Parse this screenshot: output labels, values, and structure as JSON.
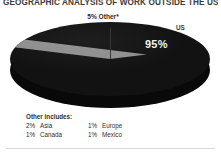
{
  "chart_data": {
    "type": "pie",
    "title": "GEOGRAPHIC ANALYSIS OF WORK OUTSIDE THE US",
    "xlabel": "",
    "ylabel": "",
    "categories": [
      "US",
      "Other"
    ],
    "values": [
      95,
      5
    ],
    "labels": [
      "95%",
      "5% Other*"
    ],
    "series_label": "US",
    "slice_colors": [
      "#121212",
      "#8e8e8e"
    ],
    "legend_position": "none",
    "grid": false,
    "annotations": {
      "us_label": "US",
      "us_value_label": "95%",
      "other_callout": "5% Other*"
    },
    "footnote": {
      "heading": "Other includes:",
      "items": [
        {
          "pct": "2%",
          "name": "Asia"
        },
        {
          "pct": "1%",
          "name": "Europe"
        },
        {
          "pct": "1%",
          "name": "Canada"
        },
        {
          "pct": "1%",
          "name": "Mexico"
        }
      ]
    }
  },
  "colors": {
    "background": "#ffffff",
    "primary_slice": "#121212",
    "other_slice": "#8e8e8e",
    "text": "#2e2e2e",
    "rule": "#d8d8d8"
  }
}
